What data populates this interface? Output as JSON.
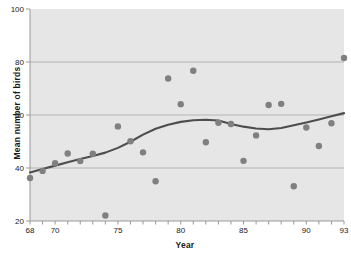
{
  "chart_data": {
    "type": "scatter",
    "title": "",
    "xlabel": "Year",
    "ylabel": "Mean number of birds",
    "xlim": [
      68,
      93
    ],
    "ylim": [
      20,
      100
    ],
    "xticks": [
      68,
      69,
      70,
      71,
      72,
      73,
      74,
      75,
      76,
      77,
      78,
      79,
      80,
      81,
      82,
      83,
      84,
      85,
      86,
      87,
      88,
      89,
      90,
      91,
      92,
      93
    ],
    "xtick_labels": [
      "68",
      "",
      "70",
      "",
      "",
      "",
      "",
      "75",
      "",
      "",
      "",
      "",
      "80",
      "",
      "",
      "",
      "",
      "85",
      "",
      "",
      "",
      "",
      "90",
      "",
      "",
      "93"
    ],
    "yticks": [
      20,
      40,
      60,
      80,
      100
    ],
    "ytick_labels": [
      "20",
      "40",
      "60",
      "80",
      "100"
    ],
    "grid": "horizontal",
    "legend": "none",
    "x": [
      68,
      69,
      70,
      71,
      72,
      73,
      74,
      75,
      76,
      77,
      78,
      79,
      80,
      81,
      82,
      83,
      84,
      85,
      86,
      87,
      88,
      89,
      90,
      91,
      92,
      93
    ],
    "y": [
      36.2,
      38.9,
      41.8,
      45.5,
      42.6,
      45.4,
      22.1,
      55.7,
      50.1,
      45.9,
      35.0,
      73.8,
      64.1,
      76.7,
      49.7,
      57.1,
      56.6,
      42.7,
      52.3,
      63.8,
      64.2,
      33.1,
      55.3,
      48.3,
      56.9,
      81.5
    ],
    "trend": {
      "name": "smoothed-trend",
      "x": [
        68,
        69,
        70,
        71,
        72,
        73,
        74,
        75,
        76,
        77,
        78,
        79,
        80,
        81,
        82,
        83,
        84,
        85,
        86,
        87,
        88,
        89,
        90,
        91,
        92,
        93
      ],
      "y": [
        38.3,
        39.6,
        40.9,
        42.2,
        43.4,
        44.5,
        45.8,
        47.6,
        49.9,
        52.6,
        54.8,
        56.3,
        57.4,
        58.0,
        58.2,
        57.9,
        56.6,
        55.6,
        54.9,
        54.6,
        55.1,
        56.1,
        57.2,
        58.3,
        59.5,
        60.7
      ]
    },
    "marker": {
      "shape": "circle",
      "color": "#808080",
      "size": 4.2
    },
    "line": {
      "color": "#4d4d4d",
      "width": 2.1
    },
    "plot_background": "#e6e6e6",
    "grid_color": "#a6a6a6",
    "axis_color": "#999999",
    "text_color": "#1a1a1a"
  }
}
